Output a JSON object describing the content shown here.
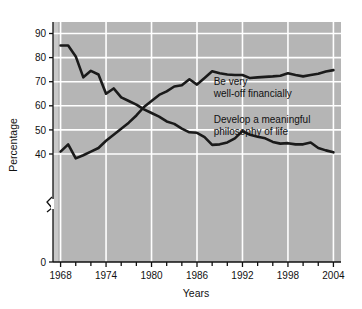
{
  "chart_data": {
    "type": "line",
    "title": "",
    "xlabel": "Years",
    "ylabel": "Percentage",
    "xlim": [
      1967,
      2005
    ],
    "ylim": [
      36,
      93
    ],
    "yaxis_break": true,
    "yaxis_break_from": 0,
    "grid": true,
    "grid_color": "#ffffff",
    "plot_background": "#b5b5b5",
    "line_color": "#1a1a1a",
    "legend_position": "inline-annotation",
    "xticks": [
      1968,
      1974,
      1980,
      1986,
      1992,
      1998,
      2004
    ],
    "xtick_labels": [
      "1968",
      "1974",
      "1980",
      "1986",
      "1992",
      "1998",
      "2004"
    ],
    "xminor_step": 2,
    "yticks": [
      0,
      40,
      50,
      60,
      70,
      80,
      90
    ],
    "ytick_labels": [
      "0",
      "40",
      "50",
      "60",
      "70",
      "80",
      "90"
    ],
    "series": [
      {
        "name": "Be very well-off financially",
        "label_line1": "Be very",
        "label_line2": "well-off financially",
        "label_x": 1988.2,
        "label_y": 68.5,
        "x": [
          1968,
          1969,
          1970,
          1971,
          1972,
          1973,
          1974,
          1975,
          1976,
          1977,
          1978,
          1979,
          1980,
          1981,
          1982,
          1983,
          1984,
          1985,
          1986,
          1987,
          1988,
          1989,
          1990,
          1991,
          1992,
          1993,
          1994,
          1995,
          1996,
          1997,
          1998,
          1999,
          2000,
          2001,
          2002,
          2003,
          2004
        ],
        "y": [
          41.0,
          44.0,
          38.2,
          39.5,
          41.0,
          42.5,
          45.5,
          48.0,
          50.5,
          53.0,
          56.0,
          59.5,
          62.0,
          64.5,
          66.0,
          68.0,
          68.5,
          71.0,
          68.8,
          71.5,
          74.3,
          73.5,
          73.0,
          72.8,
          72.8,
          71.5,
          71.8,
          72.0,
          72.2,
          72.5,
          73.5,
          72.8,
          72.2,
          72.8,
          73.3,
          74.2,
          74.8
        ]
      },
      {
        "name": "Develop a meaningful philosophy of life",
        "label_line1": "Develop a meaningful",
        "label_line2": "philosophy of life",
        "label_x": 1988.2,
        "label_y": 53.0,
        "x": [
          1968,
          1969,
          1970,
          1971,
          1972,
          1973,
          1974,
          1975,
          1976,
          1977,
          1978,
          1979,
          1980,
          1981,
          1982,
          1983,
          1984,
          1985,
          1986,
          1987,
          1988,
          1989,
          1990,
          1991,
          1992,
          1993,
          1994,
          1995,
          1996,
          1997,
          1998,
          1999,
          2000,
          2001,
          2002,
          2003,
          2004
        ],
        "y": [
          85.0,
          85.0,
          80.5,
          71.8,
          74.5,
          73.0,
          65.0,
          67.2,
          63.5,
          62.0,
          60.5,
          58.5,
          57.0,
          55.5,
          53.5,
          52.5,
          50.5,
          49.0,
          48.8,
          47.0,
          43.8,
          44.0,
          44.8,
          46.5,
          49.5,
          48.0,
          47.2,
          46.5,
          45.0,
          44.3,
          44.5,
          44.0,
          44.0,
          44.8,
          42.5,
          41.5,
          40.7
        ]
      }
    ]
  },
  "axes": {
    "x_title": "Years",
    "y_title": "Percentage"
  }
}
